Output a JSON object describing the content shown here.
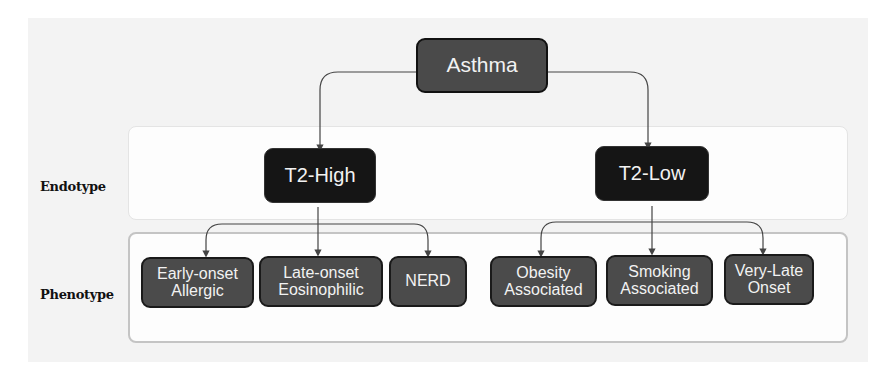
{
  "diagram": {
    "root": {
      "label": "Asthma"
    },
    "rows": {
      "endotype_label": "Endotype",
      "phenotype_label": "Phenotype"
    },
    "endotypes": [
      {
        "label": "T2-High",
        "phenotypes": [
          {
            "label": "Early-onset\nAllergic"
          },
          {
            "label": "Late-onset\nEosinophilic"
          },
          {
            "label": "NERD"
          }
        ]
      },
      {
        "label": "T2-Low",
        "phenotypes": [
          {
            "label": "Obesity\nAssociated"
          },
          {
            "label": "Smoking\nAssociated"
          },
          {
            "label": "Very-Late\nOnset"
          }
        ]
      }
    ],
    "colors": {
      "root_fill": "#4a4a4a",
      "endotype_fill": "#151515",
      "phenotype_fill": "#4b4b4b",
      "text": "#f2f2f2",
      "connector": "#444444"
    }
  }
}
